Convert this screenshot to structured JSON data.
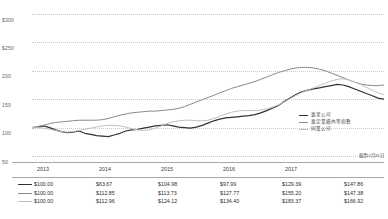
{
  "chart_data": {
    "type": "line",
    "title": "",
    "xlabel": "",
    "ylabel": "",
    "ylim": [
      50,
      300
    ],
    "grid": true,
    "legend_position": "inside-bottom-right",
    "yticks": [
      "$300",
      "$250",
      "200",
      "150",
      "100",
      "50"
    ],
    "ytick_values": [
      300,
      250,
      200,
      150,
      100,
      50
    ],
    "categories": [
      "2013",
      "2014",
      "2015",
      "2016",
      "2017",
      "2018"
    ],
    "x": [
      2013,
      2014,
      2015,
      2016,
      2017,
      2018
    ],
    "series": [
      {
        "name": "嘉里公司",
        "color": "#333333",
        "values": [
          100.0,
          63.67,
          104.98,
          97.99,
          129.39,
          147.86
        ],
        "monthly": [
          100,
          101,
          103,
          100,
          96,
          93,
          91,
          92,
          94,
          90,
          88,
          86,
          85,
          84,
          87,
          90,
          94,
          96,
          97,
          99,
          101,
          103,
          104,
          105,
          103,
          101,
          100,
          99,
          101,
          104,
          108,
          112,
          115,
          117,
          118,
          119,
          120,
          121,
          123,
          126,
          130,
          134,
          139,
          146,
          152,
          158,
          163,
          166,
          168,
          170,
          172,
          174,
          176,
          175,
          172,
          168,
          164,
          160,
          156,
          152,
          150
        ]
      },
      {
        "name": "嘉定業績內等指數",
        "color": "#8a8a8a",
        "values": [
          100.0,
          112.85,
          113.73,
          127.77,
          155.2,
          147.38
        ],
        "monthly": [
          100,
          102,
          104,
          107,
          109,
          110,
          111,
          112,
          113,
          113,
          113,
          113,
          114,
          116,
          119,
          122,
          124,
          126,
          127,
          128,
          129,
          129,
          130,
          131,
          132,
          134,
          137,
          141,
          145,
          149,
          153,
          157,
          161,
          165,
          169,
          172,
          175,
          178,
          181,
          185,
          189,
          193,
          197,
          200,
          203,
          205,
          206,
          206,
          205,
          203,
          200,
          196,
          192,
          188,
          184,
          180,
          177,
          175,
          174,
          174,
          175
        ]
      },
      {
        "name": "同業公司",
        "color": "#bfbfbf",
        "values": [
          100.0,
          112.96,
          124.12,
          134.4,
          183.37,
          166.92
        ],
        "monthly": [
          100,
          100,
          99,
          97,
          95,
          93,
          92,
          93,
          95,
          97,
          99,
          101,
          103,
          104,
          104,
          103,
          101,
          98,
          96,
          95,
          96,
          99,
          103,
          107,
          110,
          112,
          113,
          113,
          112,
          112,
          113,
          116,
          120,
          124,
          127,
          129,
          130,
          130,
          130,
          131,
          133,
          136,
          140,
          145,
          151,
          157,
          162,
          166,
          170,
          174,
          178,
          182,
          185,
          186,
          184,
          180,
          176,
          171,
          166,
          161,
          158
        ]
      }
    ]
  },
  "footnote": "截至11月31日",
  "legend": {
    "items": [
      {
        "label": "嘉里公司",
        "color": "#333333"
      },
      {
        "label": "嘉定業績內等指數",
        "color": "#8a8a8a"
      },
      {
        "label": "同業公司",
        "color": "#bfbfbf"
      }
    ]
  },
  "xaxis": {
    "ticks": [
      "2013",
      "2014",
      "2015",
      "2016",
      "2017"
    ]
  },
  "table": {
    "rows": [
      {
        "color": "#333333",
        "cells": [
          "$100.00",
          "$63.67",
          "$104.98",
          "$97.99",
          "$129.39",
          "$147.86"
        ]
      },
      {
        "color": "#8a8a8a",
        "cells": [
          "$100.00",
          "$112.85",
          "$113.73",
          "$127.77",
          "$155.20",
          "$147.38"
        ]
      },
      {
        "color": "#bfbfbf",
        "cells": [
          "$100.00",
          "$112.96",
          "$124.12",
          "$134.40",
          "$183.37",
          "$166.92"
        ]
      }
    ]
  }
}
